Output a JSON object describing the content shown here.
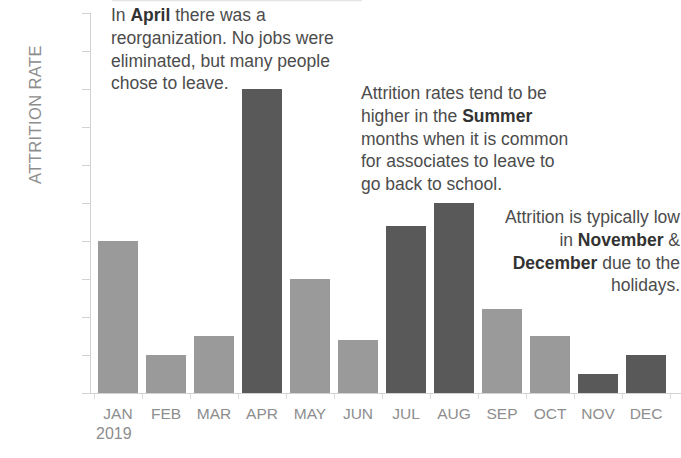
{
  "chart_data": {
    "type": "bar",
    "title": "",
    "xlabel": "2019",
    "ylabel": "ATTRITION RATE",
    "categories": [
      "JAN",
      "FEB",
      "MAR",
      "APR",
      "MAY",
      "JUN",
      "JUL",
      "AUG",
      "SEP",
      "OCT",
      "NOV",
      "DEC"
    ],
    "values": [
      0.4,
      0.1,
      0.15,
      0.8,
      0.3,
      0.14,
      0.44,
      0.5,
      0.22,
      0.15,
      0.05,
      0.1
    ],
    "value_unit": "%",
    "ylim": [
      0.0,
      1.0
    ],
    "ytick_labels": [
      "1.0%",
      "0.9%",
      "0.8%",
      "0.7%",
      "0.6%",
      "0.5%",
      "0.4%",
      "0.3%",
      "0.2%",
      "0.1%",
      "0.0%"
    ],
    "ytick_values": [
      1.0,
      0.9,
      0.8,
      0.7,
      0.6,
      0.5,
      0.4,
      0.3,
      0.2,
      0.1,
      0.0
    ],
    "grid": false,
    "legend": null,
    "bar_emphasis": [
      "light",
      "light",
      "light",
      "dark",
      "light",
      "light",
      "dark",
      "dark",
      "light",
      "light",
      "dark",
      "dark"
    ],
    "colors": {
      "bar_light": "#9a9a9a",
      "bar_dark": "#595959",
      "axis": "#d2d2d2",
      "tick_label": "#8d8d8d",
      "annotation": "#4c4c4c",
      "annotation_bold": "#333333"
    },
    "annotations": [
      {
        "id": "april",
        "segments": [
          {
            "text": "In ",
            "bold": false
          },
          {
            "text": "April",
            "bold": true
          },
          {
            "text": " there was a reorganization. No jobs were eliminated, but many people chose to leave.",
            "bold": false
          }
        ]
      },
      {
        "id": "summer",
        "segments": [
          {
            "text": "Attrition rates tend to be higher in the ",
            "bold": false
          },
          {
            "text": "Summer",
            "bold": true
          },
          {
            "text": " months when it is common for associates to leave to go back to school.",
            "bold": false
          }
        ]
      },
      {
        "id": "november-december",
        "segments": [
          {
            "text": "Attrition is typically low in ",
            "bold": false
          },
          {
            "text": "November",
            "bold": true
          },
          {
            "text": " & ",
            "bold": false
          },
          {
            "text": "December",
            "bold": true
          },
          {
            "text": " due to the holidays.",
            "bold": false
          }
        ]
      }
    ]
  }
}
